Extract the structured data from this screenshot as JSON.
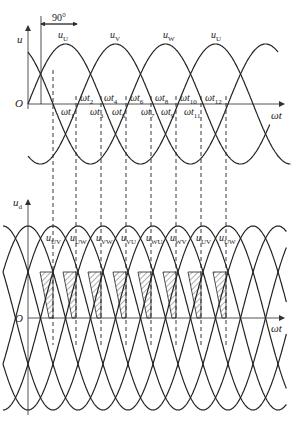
{
  "upper_plot": {
    "y_axis_label": "u",
    "x_axis_label": "ωt",
    "origin_label": "O",
    "bracket_label": "90°",
    "phase_labels": [
      {
        "base": "u",
        "sub": "U",
        "x": 58,
        "y": 30
      },
      {
        "base": "u",
        "sub": "V",
        "x": 110,
        "y": 30
      },
      {
        "base": "u",
        "sub": "W",
        "x": 163,
        "y": 30
      },
      {
        "base": "u",
        "sub": "U",
        "x": 211,
        "y": 30
      }
    ],
    "instant_labels": [
      {
        "base": "ωt",
        "sub": "1",
        "x": 61,
        "y": 107
      },
      {
        "base": "ωt",
        "sub": "2",
        "x": 80,
        "y": 93
      },
      {
        "base": "ωt",
        "sub": "3",
        "x": 90,
        "y": 107
      },
      {
        "base": "ωt",
        "sub": "4",
        "x": 104,
        "y": 93
      },
      {
        "base": "ωt",
        "sub": "5",
        "x": 112,
        "y": 107
      },
      {
        "base": "ωt",
        "sub": "6",
        "x": 130,
        "y": 93
      },
      {
        "base": "ωt",
        "sub": "7",
        "x": 141,
        "y": 107
      },
      {
        "base": "ωt",
        "sub": "8",
        "x": 155,
        "y": 93
      },
      {
        "base": "ωt",
        "sub": "9",
        "x": 161,
        "y": 107
      },
      {
        "base": "ωt",
        "sub": "10",
        "x": 180,
        "y": 93
      },
      {
        "base": "ωt",
        "sub": "11",
        "x": 184,
        "y": 107
      },
      {
        "base": "ωt",
        "sub": "12",
        "x": 205,
        "y": 93
      }
    ]
  },
  "lower_plot": {
    "y_axis_label": "u",
    "y_axis_sub": "d",
    "x_axis_label": "ωt",
    "origin_label": "O",
    "line_voltage_labels": [
      {
        "base": "u",
        "sub": "UV",
        "x": 46,
        "y": 233
      },
      {
        "base": "u",
        "sub": "UW",
        "x": 70,
        "y": 233
      },
      {
        "base": "u",
        "sub": "VW",
        "x": 96,
        "y": 233
      },
      {
        "base": "u",
        "sub": "VU",
        "x": 121,
        "y": 233
      },
      {
        "base": "u",
        "sub": "WU",
        "x": 146,
        "y": 233
      },
      {
        "base": "u",
        "sub": "WV",
        "x": 170,
        "y": 233
      },
      {
        "base": "u",
        "sub": "UV",
        "x": 196,
        "y": 233
      },
      {
        "base": "u",
        "sub": "UW",
        "x": 219,
        "y": 233
      }
    ]
  },
  "chart_data": {
    "type": "line",
    "upper": {
      "ylabel": "u",
      "xlabel": "ωt",
      "series": [
        "u_U",
        "u_V",
        "u_W"
      ],
      "phase_shift_deg": 120,
      "bracket": "90°",
      "marked_instants": [
        "ωt1",
        "ωt2",
        "ωt3",
        "ωt4",
        "ωt5",
        "ωt6",
        "ωt7",
        "ωt8",
        "ωt9",
        "ωt10",
        "ωt11",
        "ωt12"
      ]
    },
    "lower": {
      "ylabel": "u_d",
      "xlabel": "ωt",
      "series": [
        "u_UV",
        "u_UW",
        "u_VW",
        "u_VU",
        "u_WU",
        "u_WV",
        "u_UV",
        "u_UW"
      ],
      "hatched_regions": 8
    }
  },
  "geometry": {
    "x0": 28,
    "px_per_deg": 0.4167,
    "upper_zero_y": 104,
    "upper_amp": 60,
    "lower_zero_y": 318,
    "lower_amp": 92,
    "dash_x": [
      53,
      76,
      101,
      126,
      151,
      176,
      201,
      226
    ]
  },
  "colors": {
    "stroke": "#222222",
    "axis": "#555555",
    "background": "#ffffff"
  }
}
